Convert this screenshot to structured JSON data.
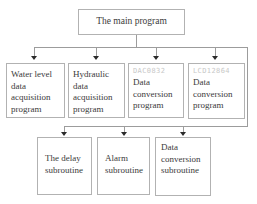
{
  "diagram": {
    "background": "#ffffff",
    "colors": {
      "box_border": "#b2b2b2",
      "connector_line": "#9c9c9c",
      "arrowhead": "#2a2a2a",
      "text": "#3b3b3b",
      "chip_label_text": "#c8c8c8"
    },
    "main": {
      "label": "The main program"
    },
    "level2": [
      {
        "lines": [
          "Water level",
          "data",
          "acquisition",
          "program"
        ]
      },
      {
        "lines": [
          "Hydraulic",
          "data",
          "acquisition",
          "program"
        ]
      },
      {
        "chip": "DAC0832",
        "lines": [
          "Data",
          "conversion",
          "program"
        ]
      },
      {
        "chip": "LCD12864",
        "lines": [
          "Data",
          "conversion",
          "program"
        ]
      }
    ],
    "level3": [
      {
        "lines": [
          "The delay",
          "subroutine"
        ]
      },
      {
        "lines": [
          "Alarm",
          "subroutine"
        ]
      },
      {
        "lines": [
          "Data",
          "conversion",
          "subroutine"
        ]
      }
    ]
  }
}
